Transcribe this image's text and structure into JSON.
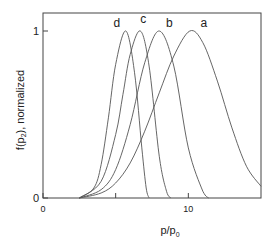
{
  "chart_data": {
    "type": "line",
    "title": "",
    "xlabel": "p/p0",
    "xlabel_main": "p/p",
    "xlabel_sub": "0",
    "ylabel": "f(p2), normalized",
    "ylabel_pre": "f(p",
    "ylabel_sub": "2",
    "ylabel_post": "), normalized",
    "xlim": [
      0,
      15
    ],
    "ylim": [
      0,
      1.08
    ],
    "x_ticks": [
      0,
      5,
      10
    ],
    "x_tick_labels": [
      "0",
      "",
      "10"
    ],
    "y_ticks": [
      0,
      1
    ],
    "y_tick_labels": [
      "0",
      "1"
    ],
    "grid": false,
    "legend": "inline labels at curve peaks",
    "series": [
      {
        "name": "a",
        "peak_x": 10.1,
        "x": [
          2.5,
          4,
          5,
          6,
          7,
          8,
          9,
          10.1,
          11,
          12,
          13,
          14,
          15
        ],
        "values": [
          0.0,
          0.03,
          0.09,
          0.21,
          0.4,
          0.63,
          0.85,
          1.0,
          0.93,
          0.7,
          0.42,
          0.19,
          0.07
        ]
      },
      {
        "name": "b",
        "peak_x": 8.0,
        "x": [
          2.5,
          4,
          5,
          6,
          7,
          8,
          9,
          10,
          11,
          11.4
        ],
        "values": [
          0.0,
          0.05,
          0.17,
          0.44,
          0.81,
          1.0,
          0.79,
          0.3,
          0.04,
          0.0
        ]
      },
      {
        "name": "c",
        "peak_x": 6.7,
        "x": [
          2.5,
          4,
          5,
          5.5,
          6,
          6.7,
          7.3,
          8,
          8.5,
          8.8
        ],
        "values": [
          0.0,
          0.1,
          0.38,
          0.62,
          0.86,
          1.0,
          0.79,
          0.25,
          0.04,
          0.0
        ]
      },
      {
        "name": "d",
        "peak_x": 5.7,
        "x": [
          2.5,
          3.5,
          4,
          4.5,
          5,
          5.7,
          6.3,
          6.8,
          7.1,
          7.3
        ],
        "values": [
          0.0,
          0.06,
          0.2,
          0.48,
          0.8,
          1.0,
          0.75,
          0.3,
          0.06,
          0.0
        ]
      }
    ],
    "line_color": "#555555"
  }
}
